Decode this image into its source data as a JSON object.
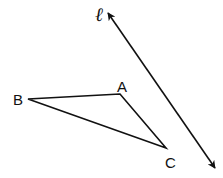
{
  "diagram": {
    "stroke_color": "#111111",
    "background": "#ffffff",
    "line": {
      "label": "ℓ",
      "x1": 108,
      "y1": 13,
      "x2": 215,
      "y2": 168,
      "label_x": 95,
      "label_y": 21
    },
    "triangle": {
      "vertices": [
        {
          "name": "A",
          "x": 120,
          "y": 94,
          "label_x": 117,
          "label_y": 92
        },
        {
          "name": "B",
          "x": 28,
          "y": 99,
          "label_x": 13,
          "label_y": 105
        },
        {
          "name": "C",
          "x": 166,
          "y": 148,
          "label_x": 165,
          "label_y": 168
        }
      ]
    }
  }
}
